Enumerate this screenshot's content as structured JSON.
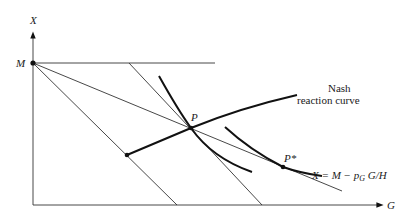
{
  "diagram": {
    "axes": {
      "y_label": "X",
      "x_label": "G",
      "intercept_label": "M"
    },
    "labels": {
      "nash": [
        "Nash",
        "reaction curve"
      ],
      "point_p": "P",
      "point_p_star": "P*",
      "budget_equation": "X = M − p",
      "budget_sub": "G",
      "budget_tail": " G/H"
    },
    "colors": {
      "ink": "#111111",
      "background": "#ffffff"
    }
  }
}
